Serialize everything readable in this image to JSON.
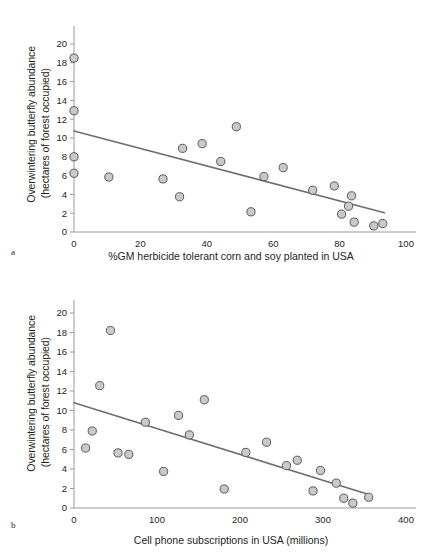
{
  "figure": {
    "panel_a_letter": "a",
    "panel_b_letter": "b",
    "marker_fill": "#c9c9c9",
    "marker_stroke": "#58595b",
    "line_color": "#6d6e71",
    "axis_color": "#9b9b9b"
  },
  "chart_data": [
    {
      "type": "scatter",
      "panel": "a",
      "title": "",
      "xlabel": "%GM herbicide tolerant corn and soy planted in USA",
      "ylabel_line1": "Overwintering butterfly abundance",
      "ylabel_line2": "(hectares of forest occupied)",
      "xlim": [
        0,
        100
      ],
      "ylim": [
        0,
        20
      ],
      "xticks": [
        0,
        20,
        40,
        60,
        80,
        100
      ],
      "yticks": [
        0,
        2,
        4,
        6,
        8,
        10,
        12,
        14,
        16,
        18,
        20
      ],
      "grid": false,
      "legend": "none",
      "points": [
        {
          "x": 0.0,
          "y": 18.5
        },
        {
          "x": 0.0,
          "y": 12.9
        },
        {
          "x": 0.0,
          "y": 8.0
        },
        {
          "x": 0.0,
          "y": 6.25
        },
        {
          "x": 10.5,
          "y": 5.85
        },
        {
          "x": 26.8,
          "y": 5.65
        },
        {
          "x": 31.8,
          "y": 3.75
        },
        {
          "x": 32.7,
          "y": 8.9
        },
        {
          "x": 38.6,
          "y": 9.4
        },
        {
          "x": 44.2,
          "y": 7.5
        },
        {
          "x": 48.9,
          "y": 11.2
        },
        {
          "x": 53.3,
          "y": 2.15
        },
        {
          "x": 57.2,
          "y": 5.9
        },
        {
          "x": 63.0,
          "y": 6.85
        },
        {
          "x": 71.9,
          "y": 4.45
        },
        {
          "x": 78.4,
          "y": 4.9
        },
        {
          "x": 80.6,
          "y": 1.9
        },
        {
          "x": 82.7,
          "y": 2.75
        },
        {
          "x": 83.6,
          "y": 3.85
        },
        {
          "x": 84.4,
          "y": 1.05
        },
        {
          "x": 90.3,
          "y": 0.65
        },
        {
          "x": 93.0,
          "y": 0.9
        }
      ],
      "regression_line": {
        "x1": 0.0,
        "y1": 10.75,
        "x2": 93.5,
        "y2": 2.05
      }
    },
    {
      "type": "scatter",
      "panel": "b",
      "title": "",
      "xlabel": "Cell phone subscriptions in USA (millions)",
      "ylabel_line1": "Overwintering butterfly abundance",
      "ylabel_line2": "(hectares of forest occupied)",
      "xlim": [
        0,
        400
      ],
      "ylim": [
        0,
        20
      ],
      "xticks": [
        0,
        100,
        200,
        300,
        400
      ],
      "yticks": [
        0,
        2,
        4,
        6,
        8,
        10,
        12,
        14,
        16,
        18,
        20
      ],
      "grid": false,
      "legend": "none",
      "points": [
        {
          "x": 14,
          "y": 6.15
        },
        {
          "x": 22,
          "y": 7.9
        },
        {
          "x": 31,
          "y": 12.55
        },
        {
          "x": 44,
          "y": 18.2
        },
        {
          "x": 53,
          "y": 5.65
        },
        {
          "x": 66,
          "y": 5.5
        },
        {
          "x": 86,
          "y": 8.8
        },
        {
          "x": 108,
          "y": 3.75
        },
        {
          "x": 126,
          "y": 9.5
        },
        {
          "x": 139,
          "y": 7.5
        },
        {
          "x": 157,
          "y": 11.1
        },
        {
          "x": 181,
          "y": 1.95
        },
        {
          "x": 207,
          "y": 5.7
        },
        {
          "x": 232,
          "y": 6.75
        },
        {
          "x": 256,
          "y": 4.35
        },
        {
          "x": 269,
          "y": 4.9
        },
        {
          "x": 288,
          "y": 1.75
        },
        {
          "x": 297,
          "y": 3.85
        },
        {
          "x": 316,
          "y": 2.55
        },
        {
          "x": 325,
          "y": 1.0
        },
        {
          "x": 336,
          "y": 0.5
        },
        {
          "x": 355,
          "y": 1.1
        }
      ],
      "regression_line": {
        "x1": 0,
        "y1": 10.8,
        "x2": 358,
        "y2": 1.3
      }
    }
  ]
}
